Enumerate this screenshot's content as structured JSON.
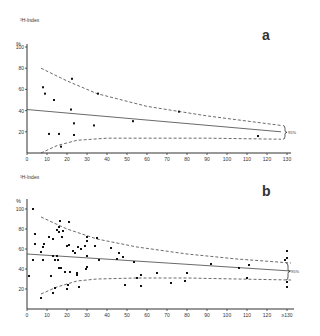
{
  "chart_data": [
    {
      "panel": "a",
      "type": "scatter",
      "title": "",
      "panel_label": "a",
      "ylabel_top": "³H-Index",
      "yunit": "%",
      "xlabel": "",
      "xlim": [
        0,
        130
      ],
      "ylim": [
        0,
        100
      ],
      "xticks": [
        "0",
        "10",
        "20",
        "30",
        "40",
        "50",
        "60",
        "70",
        "80",
        "90",
        "100",
        "110",
        "120",
        "130"
      ],
      "yticks": [
        "20",
        "40",
        "60",
        "80",
        "100"
      ],
      "grid": false,
      "points": [
        {
          "x": 8,
          "y": 62
        },
        {
          "x": 9,
          "y": 56
        },
        {
          "x": 13.5,
          "y": 50
        },
        {
          "x": 22,
          "y": 41
        },
        {
          "x": 23.5,
          "y": 28
        },
        {
          "x": 11,
          "y": 18
        },
        {
          "x": 16,
          "y": 18
        },
        {
          "x": 23.5,
          "y": 17
        },
        {
          "x": 17,
          "y": 6
        },
        {
          "x": 33.5,
          "y": 26
        },
        {
          "x": 53,
          "y": 30
        },
        {
          "x": 35.5,
          "y": 56
        },
        {
          "x": 22.5,
          "y": 70
        },
        {
          "x": 76,
          "y": 39
        },
        {
          "x": 115.5,
          "y": 16
        }
      ],
      "regression": {
        "x": [
          0,
          127
        ],
        "y": [
          41,
          20
        ]
      },
      "upper_ci": {
        "x": [
          7,
          20,
          35,
          60,
          90,
          127
        ],
        "y": [
          80,
          68,
          56,
          44,
          35,
          26
        ]
      },
      "lower_ci": {
        "x": [
          7,
          15,
          25,
          40,
          60,
          90,
          127
        ],
        "y": [
          0,
          7,
          12,
          14,
          14,
          14,
          13
        ]
      },
      "ci_label": "95%"
    },
    {
      "panel": "b",
      "type": "scatter",
      "title": "",
      "panel_label": "b",
      "ylabel_top": "³H-Index",
      "yunit": "%",
      "xlabel": "",
      "xlim": [
        0,
        130
      ],
      "ylim": [
        0,
        100
      ],
      "xticks": [
        "0",
        "10",
        "20",
        "30",
        "40",
        "50",
        "60",
        "70",
        "80",
        "90",
        "100",
        "110",
        "120",
        "≥130"
      ],
      "yticks": [
        "20",
        "40",
        "60",
        "80",
        "100"
      ],
      "grid": false,
      "points": [
        {
          "x": 3,
          "y": 100
        },
        {
          "x": 4,
          "y": 75
        },
        {
          "x": 4,
          "y": 65
        },
        {
          "x": 7,
          "y": 57
        },
        {
          "x": 8,
          "y": 62
        },
        {
          "x": 8.5,
          "y": 65
        },
        {
          "x": 11,
          "y": 72
        },
        {
          "x": 13,
          "y": 70
        },
        {
          "x": 15,
          "y": 79
        },
        {
          "x": 16,
          "y": 82
        },
        {
          "x": 16,
          "y": 77
        },
        {
          "x": 16.5,
          "y": 88
        },
        {
          "x": 18,
          "y": 78
        },
        {
          "x": 17.5,
          "y": 72
        },
        {
          "x": 21,
          "y": 87
        },
        {
          "x": 20,
          "y": 63
        },
        {
          "x": 21,
          "y": 64
        },
        {
          "x": 23,
          "y": 58
        },
        {
          "x": 24,
          "y": 56
        },
        {
          "x": 25.5,
          "y": 62
        },
        {
          "x": 27,
          "y": 60
        },
        {
          "x": 29,
          "y": 63
        },
        {
          "x": 30,
          "y": 72
        },
        {
          "x": 30,
          "y": 68
        },
        {
          "x": 34,
          "y": 63
        },
        {
          "x": 35,
          "y": 71
        },
        {
          "x": 42,
          "y": 61
        },
        {
          "x": 3,
          "y": 49
        },
        {
          "x": 1,
          "y": 33
        },
        {
          "x": 8,
          "y": 49
        },
        {
          "x": 13,
          "y": 53
        },
        {
          "x": 14,
          "y": 49
        },
        {
          "x": 15,
          "y": 53
        },
        {
          "x": 15.5,
          "y": 49
        },
        {
          "x": 16,
          "y": 41
        },
        {
          "x": 17,
          "y": 41
        },
        {
          "x": 19,
          "y": 37
        },
        {
          "x": 21.5,
          "y": 37
        },
        {
          "x": 12,
          "y": 33
        },
        {
          "x": 25,
          "y": 36
        },
        {
          "x": 25,
          "y": 34
        },
        {
          "x": 29.5,
          "y": 40
        },
        {
          "x": 30,
          "y": 42
        },
        {
          "x": 30,
          "y": 53
        },
        {
          "x": 36,
          "y": 49
        },
        {
          "x": 45,
          "y": 50
        },
        {
          "x": 46,
          "y": 56
        },
        {
          "x": 48,
          "y": 52
        },
        {
          "x": 53.5,
          "y": 47
        },
        {
          "x": 7,
          "y": 11
        },
        {
          "x": 13,
          "y": 16
        },
        {
          "x": 14,
          "y": 21
        },
        {
          "x": 20,
          "y": 20
        },
        {
          "x": 20.5,
          "y": 24
        },
        {
          "x": 26,
          "y": 22
        },
        {
          "x": 49,
          "y": 24
        },
        {
          "x": 55,
          "y": 31
        },
        {
          "x": 57,
          "y": 34
        },
        {
          "x": 57,
          "y": 23
        },
        {
          "x": 65,
          "y": 36
        },
        {
          "x": 72,
          "y": 26
        },
        {
          "x": 79,
          "y": 28
        },
        {
          "x": 80,
          "y": 36
        },
        {
          "x": 92,
          "y": 45
        },
        {
          "x": 106,
          "y": 41
        },
        {
          "x": 110,
          "y": 31
        },
        {
          "x": 111,
          "y": 44
        },
        {
          "x": 130,
          "y": 58
        },
        {
          "x": 130,
          "y": 51
        },
        {
          "x": 129,
          "y": 49
        },
        {
          "x": 130,
          "y": 27
        },
        {
          "x": 130,
          "y": 22
        }
      ],
      "regression": {
        "x": [
          0,
          132
        ],
        "y": [
          55,
          38
        ]
      },
      "upper_ci": {
        "x": [
          7,
          20,
          35,
          55,
          80,
          105,
          132
        ],
        "y": [
          92,
          80,
          70,
          62,
          55,
          50,
          46
        ]
      },
      "lower_ci": {
        "x": [
          7,
          15,
          25,
          35,
          55,
          80,
          105,
          132
        ],
        "y": [
          15,
          22,
          28,
          30,
          31,
          31,
          30,
          29
        ]
      },
      "ci_label": "95%"
    }
  ]
}
